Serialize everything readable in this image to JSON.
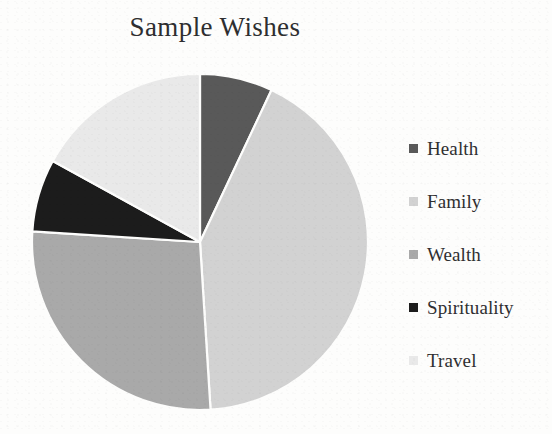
{
  "chart_data": {
    "type": "pie",
    "title": "Sample Wishes",
    "labels": [
      "Health",
      "Family",
      "Wealth",
      "Spirituality",
      "Travel"
    ],
    "values": [
      7,
      42,
      27,
      7,
      17
    ],
    "percentages": [
      7,
      42,
      27,
      7,
      17
    ],
    "angles_deg": [
      25,
      151,
      96,
      26,
      62
    ],
    "colors": [
      "#595959",
      "#d2d2d2",
      "#a9a9a9",
      "#1c1c1c",
      "#e9e9e9"
    ],
    "start_angle_deg": 0,
    "direction": "clockwise",
    "legend_position": "right",
    "grid": false,
    "xlabel": "",
    "ylabel": ""
  },
  "legend": {
    "items": [
      {
        "label": "Health",
        "color": "#595959"
      },
      {
        "label": "Family",
        "color": "#d2d2d2"
      },
      {
        "label": "Wealth",
        "color": "#a9a9a9"
      },
      {
        "label": "Spirituality",
        "color": "#1c1c1c"
      },
      {
        "label": "Travel",
        "color": "#e9e9e9"
      }
    ]
  },
  "geometry": {
    "center_x": 170,
    "center_y": 170,
    "radius": 168
  },
  "background": "#fdfdfc"
}
